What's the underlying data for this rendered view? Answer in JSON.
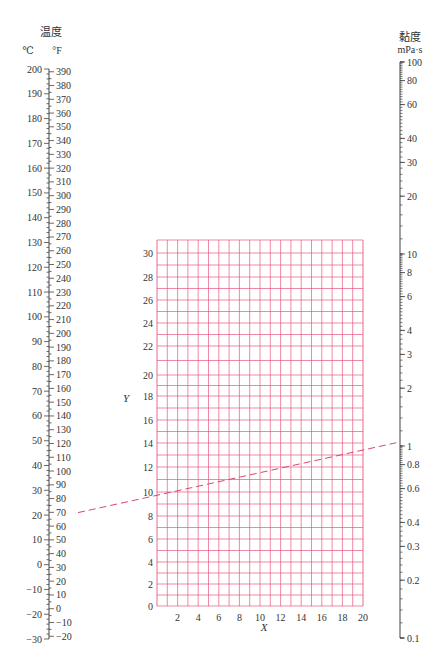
{
  "chart_data": {
    "type": "nomograph",
    "title": "",
    "left_axis": {
      "title": "温度",
      "unit_c": "℃",
      "unit_f": "°F",
      "celsius_range": [
        -30,
        200
      ],
      "celsius_ticks": [
        200,
        190,
        180,
        170,
        160,
        150,
        140,
        130,
        120,
        110,
        100,
        90,
        80,
        70,
        60,
        50,
        40,
        30,
        20,
        10,
        0,
        -10,
        -20,
        -30
      ],
      "fahrenheit_ticks": [
        390,
        380,
        370,
        360,
        350,
        340,
        330,
        320,
        310,
        300,
        290,
        280,
        270,
        260,
        250,
        240,
        230,
        220,
        210,
        200,
        190,
        180,
        170,
        160,
        150,
        140,
        130,
        120,
        110,
        100,
        90,
        80,
        70,
        60,
        50,
        40,
        30,
        20,
        10,
        0,
        -10,
        -20
      ]
    },
    "right_axis": {
      "title": "黏度",
      "unit": "mPa·s",
      "scale": "log",
      "range": [
        0.1,
        100
      ],
      "ticks": [
        100,
        80,
        60,
        40,
        30,
        20,
        10,
        8,
        6,
        4,
        3,
        2,
        1,
        0.8,
        0.6,
        0.4,
        0.3,
        0.2,
        0.1
      ]
    },
    "grid": {
      "xlabel": "X",
      "ylabel": "Y",
      "x_range": [
        0,
        20
      ],
      "y_range": [
        0,
        31
      ],
      "x_ticks": [
        2,
        4,
        6,
        8,
        10,
        12,
        14,
        16,
        18,
        20
      ],
      "y_ticks": [
        0,
        2,
        4,
        6,
        8,
        10,
        12,
        14,
        16,
        18,
        20,
        22,
        24,
        26,
        28,
        30
      ],
      "grid_color": "#e8507a"
    },
    "example_line": {
      "style": "dashed",
      "color": "#d9486e",
      "from": {
        "axis": "temperature_c",
        "value": 21
      },
      "to": {
        "axis": "viscosity",
        "value": 1.05
      },
      "crosses_grid_left_at_y": 12.4,
      "crosses_grid_right_at_y": 14.3
    }
  }
}
